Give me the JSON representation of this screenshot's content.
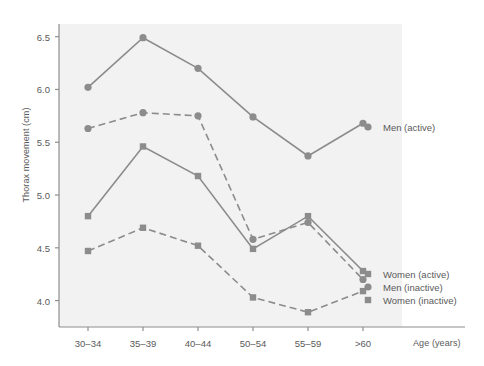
{
  "chart_data": {
    "type": "line",
    "title": "",
    "xlabel": "Age (years)",
    "ylabel": "Thorax movement (cm)",
    "categories": [
      "30–34",
      "35–39",
      "40–44",
      "50–54",
      "55–59",
      ">60"
    ],
    "yticks": [
      "4.0",
      "4.5",
      "5.0",
      "5.5",
      "6.0",
      "6.5"
    ],
    "ylim": [
      3.75,
      6.62
    ],
    "grid": false,
    "legend_position": "right-inline",
    "series": [
      {
        "name": "Men (active)",
        "marker": "circle",
        "line": "solid",
        "color": "#8c8c8c",
        "values": [
          6.02,
          6.49,
          6.2,
          5.74,
          5.37,
          5.68
        ]
      },
      {
        "name": "Men (inactive)",
        "marker": "circle",
        "line": "dashed",
        "color": "#8c8c8c",
        "values": [
          5.63,
          5.78,
          5.75,
          4.58,
          4.74,
          4.2
        ]
      },
      {
        "name": "Women (active)",
        "marker": "square",
        "line": "solid",
        "color": "#8c8c8c",
        "values": [
          4.8,
          5.46,
          5.18,
          4.49,
          4.8,
          4.28
        ]
      },
      {
        "name": "Women (inactive)",
        "marker": "square",
        "line": "dashed",
        "color": "#8c8c8c",
        "values": [
          4.47,
          4.69,
          4.52,
          4.03,
          3.89,
          4.09
        ]
      }
    ]
  },
  "legend": {
    "items": [
      {
        "label": "Men (active)",
        "x": 383,
        "y": 122
      },
      {
        "label": "Women (active)",
        "x": 383,
        "y": 269
      },
      {
        "label": "Men (inactive)",
        "x": 383,
        "y": 282
      },
      {
        "label": "Women (inactive)",
        "x": 383,
        "y": 295
      }
    ]
  },
  "style": {
    "plot_background": "#f2f2f2",
    "axis_color": "#8e8e8e",
    "series_color": "#8c8c8c",
    "text_color": "#5a5a5a"
  }
}
